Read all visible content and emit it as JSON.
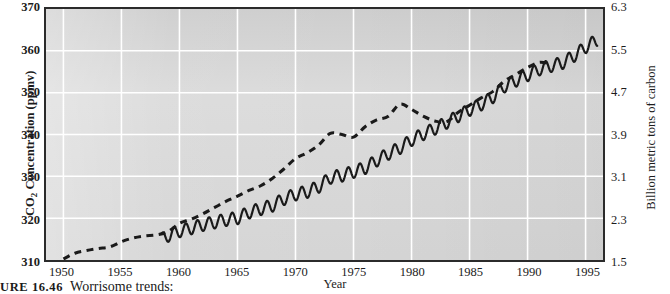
{
  "figure": {
    "caption_number": "URE 16.46",
    "caption_text": "Worrisome trends:",
    "background_color": "#d9d9d9",
    "grid_color": "#ffffff",
    "frame_color": "#2b2b2b",
    "series_color": "#1a1a1a"
  },
  "axis_titles": {
    "left": "CO2 Concentration (ppmv)",
    "right": "Billion metric tons of carbon",
    "bottom": "Year"
  },
  "chart_data": {
    "type": "line",
    "title": "Worrisome trends:",
    "xlabel": "Year",
    "ylabel": "CO2 Concentration (ppmv)",
    "ylabel_secondary": "Billion metric tons of carbon",
    "xlim": [
      1948.5,
      1996.5
    ],
    "ylim": [
      310,
      370
    ],
    "ylim_secondary": [
      1.5,
      6.3
    ],
    "grid": true,
    "legend": "none",
    "xticks": [
      1950,
      1955,
      1960,
      1965,
      1970,
      1975,
      1980,
      1985,
      1990,
      1995
    ],
    "xtick_labels": [
      "1950",
      "1955",
      "1960",
      "1965",
      "1970",
      "1975",
      "1980",
      "1985",
      "1990",
      "1995"
    ],
    "yticks": [
      310,
      320,
      330,
      340,
      350,
      360,
      370
    ],
    "ytick_labels": [
      "310",
      "320",
      "330",
      "340",
      "350",
      "360",
      "370"
    ],
    "yticks_secondary": [
      1.5,
      2.3,
      3.1,
      3.9,
      4.7,
      5.5,
      6.3
    ],
    "ytick_labels_secondary": [
      "1.5",
      "2.3",
      "3.1",
      "3.9",
      "4.7",
      "5.5",
      "6.3"
    ],
    "series": [
      {
        "name": "Carbon emissions",
        "axis": "right",
        "style": "dashed",
        "units": "billion metric tons of carbon",
        "x": [
          1950,
          1951,
          1952,
          1953,
          1954,
          1955,
          1956,
          1957,
          1958,
          1959,
          1960,
          1961,
          1962,
          1963,
          1964,
          1965,
          1966,
          1967,
          1968,
          1969,
          1970,
          1971,
          1972,
          1973,
          1974,
          1975,
          1976,
          1977,
          1978,
          1979,
          1980,
          1981,
          1982,
          1983,
          1984,
          1985,
          1986,
          1987,
          1988,
          1989,
          1990,
          1991,
          1992
        ],
        "values": [
          1.52,
          1.63,
          1.68,
          1.72,
          1.75,
          1.85,
          1.92,
          1.96,
          1.98,
          2.04,
          2.2,
          2.28,
          2.38,
          2.5,
          2.62,
          2.72,
          2.83,
          2.92,
          3.06,
          3.24,
          3.44,
          3.55,
          3.7,
          3.92,
          3.9,
          3.85,
          4.05,
          4.18,
          4.25,
          4.48,
          4.38,
          4.25,
          4.16,
          4.14,
          4.32,
          4.46,
          4.6,
          4.72,
          4.92,
          5.05,
          5.18,
          5.28,
          5.25
        ]
      },
      {
        "name": "Atmospheric CO2 concentration (Mauna Loa)",
        "axis": "left",
        "style": "solid-seasonal",
        "units": "ppmv",
        "note": "annual mean with seasonal sawtooth oscillation of about 3 ppmv peak-to-trough",
        "x": [
          1958.5,
          1959,
          1960,
          1961,
          1962,
          1963,
          1964,
          1965,
          1966,
          1967,
          1968,
          1969,
          1970,
          1971,
          1972,
          1973,
          1974,
          1975,
          1976,
          1977,
          1978,
          1979,
          1980,
          1981,
          1982,
          1983,
          1984,
          1985,
          1986,
          1987,
          1988,
          1989,
          1990,
          1991,
          1992,
          1993,
          1994,
          1995,
          1996
        ],
        "values": [
          315.0,
          315.8,
          316.9,
          317.6,
          318.4,
          319.0,
          319.6,
          320.0,
          321.4,
          322.2,
          323.0,
          324.6,
          325.7,
          326.3,
          327.5,
          329.7,
          330.2,
          331.1,
          332.0,
          333.8,
          335.4,
          336.8,
          338.7,
          340.1,
          341.4,
          342.8,
          344.4,
          345.9,
          347.2,
          348.9,
          351.5,
          352.9,
          354.2,
          355.6,
          356.4,
          357.1,
          358.8,
          360.9,
          362.6
        ],
        "seasonal_amplitude_ppmv": 3.0
      }
    ]
  }
}
